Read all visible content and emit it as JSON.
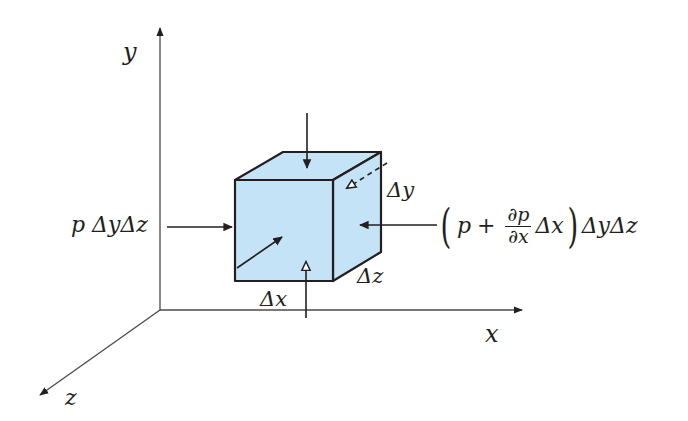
{
  "figure": {
    "type": "pressure-forces-on-fluid-element",
    "colors": {
      "cube_fill": "#c5e3f6",
      "cube_stroke": "#231f20",
      "axis_stroke": "#4a4a4a",
      "background": "#ffffff"
    },
    "axes": {
      "y_label": "y",
      "x_label": "x",
      "z_label": "z"
    },
    "cube": {
      "dx_label": "Δx",
      "dy_label": "Δy",
      "dz_label": "Δz"
    },
    "forces": {
      "left_label": {
        "p": "p",
        "rest": "ΔyΔz"
      },
      "right_label": {
        "open_paren": "(",
        "p": "p",
        "plus": "+",
        "frac_num": "∂p",
        "frac_den": "∂x",
        "dx": "Δx",
        "close_paren": ")",
        "tail": "ΔyΔz"
      }
    }
  }
}
